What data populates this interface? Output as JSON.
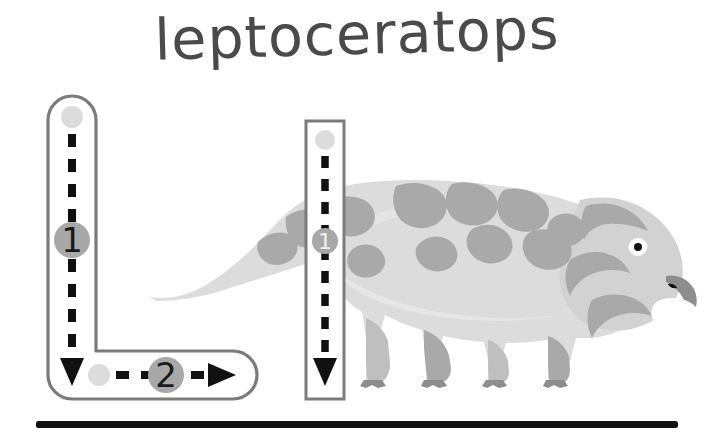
{
  "page": {
    "title": "leptoceratops",
    "worksheet_type": "letter-tracing",
    "letter_uppercase": "L",
    "letter_lowercase": "l",
    "background_color": "#ffffff"
  },
  "colors": {
    "title_text": "#4a4a4a",
    "trace_outline": "#7b7b7b",
    "stroke_dash": "#111111",
    "start_dot": "#dcdcdc",
    "step_badge_fill": "#a8a8a8",
    "step_badge_text": "#1a1a1a",
    "baseline": "#111111",
    "dino_body_light": "#dcdcdc",
    "dino_body_mid": "#c9c9c9",
    "dino_patch": "#a9a9a9",
    "dino_eye_white": "#ffffff",
    "dino_eye_pupil": "#111111",
    "dino_claw": "#8d8d8d"
  },
  "uppercase_trace": {
    "label": "uppercase-L-trace-guide",
    "strokes": [
      {
        "number": "1",
        "direction": "down",
        "badge_label": "1",
        "start_dot": true
      },
      {
        "number": "2",
        "direction": "right",
        "badge_label": "2",
        "start_dot": true
      }
    ]
  },
  "lowercase_trace": {
    "label": "lowercase-l-trace-guide",
    "strokes": [
      {
        "number": "1",
        "direction": "down",
        "badge_label": "1",
        "start_dot": true
      }
    ]
  },
  "illustration": {
    "subject": "leptoceratops",
    "description": "side view of a quadrupedal ceratopsian dinosaur with a beaked head, camouflage patches and clawed feet",
    "facing": "right"
  },
  "baseline": {
    "label": "writing-baseline"
  }
}
